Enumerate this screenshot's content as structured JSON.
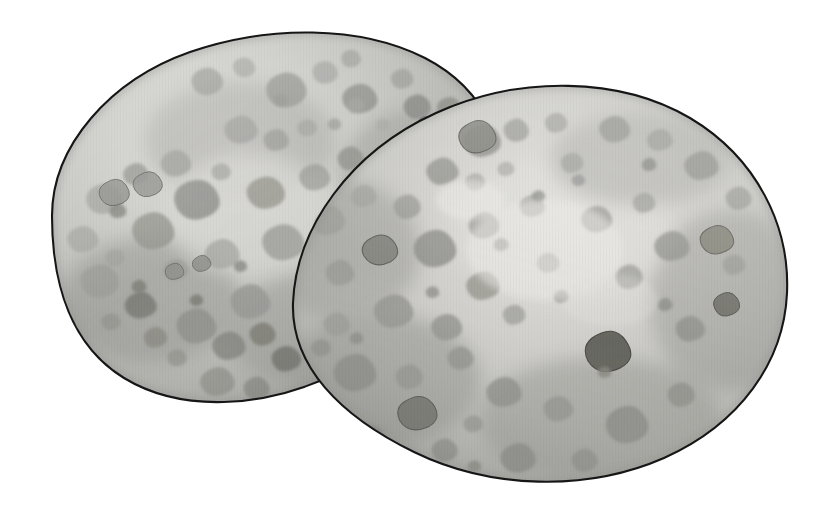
{
  "scene": {
    "title": "Two speckled bird eggs",
    "subject": "eggs",
    "count": 2,
    "style": "grayscale watercolor illustration",
    "background_color": "#ffffff",
    "canvas": {
      "width": 830,
      "height": 513
    }
  },
  "palette": {
    "background": "#ffffff",
    "outline": "#161616",
    "shell_base": "#b9b9b5",
    "shell_light": "#d2d2cf",
    "shell_highlight": "#dddcd8",
    "shell_shadow": "#a3a3a0",
    "shell_deep_shadow": "#949491",
    "speckle_light": "#a8a8a4",
    "speckle_mid": "#9a9a96",
    "speckle_dark": "#848480",
    "speckle_darkest": "#6b6b67"
  },
  "eggs": [
    {
      "id": "back-egg",
      "label": "Back egg (upper left)",
      "z_order": 1,
      "center": {
        "x": 290,
        "y": 218
      },
      "radius_x": 243,
      "radius_y": 182,
      "rotation_deg": -20,
      "path": "M 52 216 C 52 146 110 80 190 52 C 268 25 360 25 425 58 C 487 90 512 150 496 212 C 480 276 418 334 340 372 C 262 410 180 412 124 378 C 72 346 52 286 52 216 Z",
      "shading": {
        "highlight_center": {
          "x": 232,
          "y": 170
        },
        "shadow_side": "bottom-right"
      }
    },
    {
      "id": "front-egg",
      "label": "Front egg (lower right)",
      "z_order": 2,
      "center": {
        "x": 540,
        "y": 285
      },
      "radius_x": 248,
      "radius_y": 190,
      "rotation_deg": -12,
      "path": "M 293 303 C 296 228 350 152 436 113 C 520 75 620 77 690 118 C 757 158 790 226 787 293 C 784 362 740 424 664 458 C 586 492 490 489 414 452 C 340 416 291 366 293 303 Z",
      "shading": {
        "highlight_center": {
          "x": 560,
          "y": 235
        },
        "shadow_side": "bottom-left"
      }
    }
  ],
  "speckles": {
    "description": "Irregular rounded blotches scattered over both shells",
    "back_egg_count": 78,
    "front_egg_count": 86,
    "size_range_px": [
      5,
      34
    ],
    "shape": "irregular rounded polygon"
  },
  "annotations": {
    "overlap": "The front egg overlaps and partially hides the lower-right portion of the back egg.",
    "light_source": "upper-left / center highlight on each shell"
  }
}
